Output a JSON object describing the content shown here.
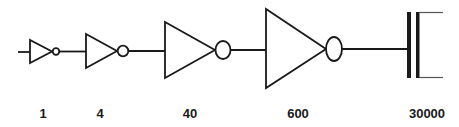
{
  "diagram": {
    "stroke_color": "#1a1a1a",
    "background": "#ffffff",
    "stages": [
      {
        "id": "inv1",
        "type": "inverter",
        "size_label": "1"
      },
      {
        "id": "inv2",
        "type": "inverter",
        "size_label": "4"
      },
      {
        "id": "inv3",
        "type": "inverter",
        "size_label": "40"
      },
      {
        "id": "inv4",
        "type": "inverter",
        "size_label": "600"
      },
      {
        "id": "load",
        "type": "capacitor",
        "size_label": "30000"
      }
    ]
  }
}
